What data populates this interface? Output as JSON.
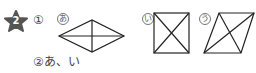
{
  "problem": {
    "number": "2",
    "part1_label": "①",
    "part2_label": "②",
    "part2_answer_text": "あ、い",
    "figures": [
      {
        "label": "あ",
        "shape": "rhombus",
        "diagonals": "perpendicular, unequal"
      },
      {
        "label": "い",
        "shape": "square",
        "diagonals": "perpendicular, equal"
      },
      {
        "label": "う",
        "shape": "parallelogram",
        "diagonals": "intersecting, unequal"
      }
    ]
  }
}
